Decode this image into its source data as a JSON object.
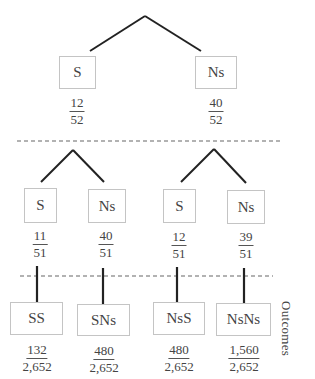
{
  "diagram": {
    "type": "probability-tree",
    "colors": {
      "line": "#222222",
      "box_border": "#c4c4c4",
      "dashed": "#666666",
      "text": "#444444"
    },
    "level1": [
      {
        "label": "S",
        "numerator": "12",
        "denominator": "52"
      },
      {
        "label": "Ns",
        "numerator": "40",
        "denominator": "52"
      }
    ],
    "level2": [
      {
        "label": "S",
        "numerator": "11",
        "denominator": "51"
      },
      {
        "label": "Ns",
        "numerator": "40",
        "denominator": "51"
      },
      {
        "label": "S",
        "numerator": "12",
        "denominator": "51"
      },
      {
        "label": "Ns",
        "numerator": "39",
        "denominator": "51"
      }
    ],
    "outcomes": [
      {
        "label": "SS",
        "numerator": "132",
        "denominator": "2,652"
      },
      {
        "label": "SNs",
        "numerator": "480",
        "denominator": "2,652"
      },
      {
        "label": "NsS",
        "numerator": "480",
        "denominator": "2,652"
      },
      {
        "label": "NsNs",
        "numerator": "1,560",
        "denominator": "2,652"
      }
    ],
    "outcomes_label": "Outcomes"
  }
}
